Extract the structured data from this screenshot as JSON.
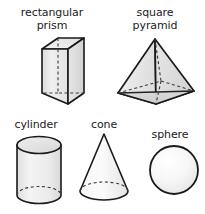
{
  "figure": {
    "background_color": "#ffffff",
    "outline_color": "#1a1a1a",
    "hidden_edge_style": "dashed",
    "label_color": "#1a1a1a",
    "fill_light": "#f7f7f7",
    "fill_mid": "#e8e8e8",
    "fill_dark": "#d6d6d6"
  },
  "shapes": [
    {
      "id": "rectangular-prism",
      "label": "rectangular\nprism",
      "label_line_1": "rectangular",
      "label_line_2": "prism",
      "row": 1,
      "column": 1,
      "solid_type": "rectangular prism",
      "visible_faces": 3,
      "hidden_edges": 3
    },
    {
      "id": "square-pyramid",
      "label": "square\npyramid",
      "label_line_1": "square",
      "label_line_2": "pyramid",
      "row": 1,
      "column": 2,
      "solid_type": "square pyramid",
      "visible_faces": 3,
      "hidden_edges": 3
    },
    {
      "id": "cylinder",
      "label": "cylinder",
      "label_line_1": "cylinder",
      "label_line_2": "",
      "row": 2,
      "column": 1,
      "solid_type": "cylinder",
      "visible_faces": 2,
      "hidden_edges": 1
    },
    {
      "id": "cone",
      "label": "cone",
      "label_line_1": "cone",
      "label_line_2": "",
      "row": 2,
      "column": 2,
      "solid_type": "cone",
      "visible_faces": 1,
      "hidden_edges": 1
    },
    {
      "id": "sphere",
      "label": "sphere",
      "label_line_1": "sphere",
      "label_line_2": "",
      "row": 2,
      "column": 3,
      "solid_type": "sphere",
      "visible_faces": 1,
      "hidden_edges": 0
    }
  ]
}
